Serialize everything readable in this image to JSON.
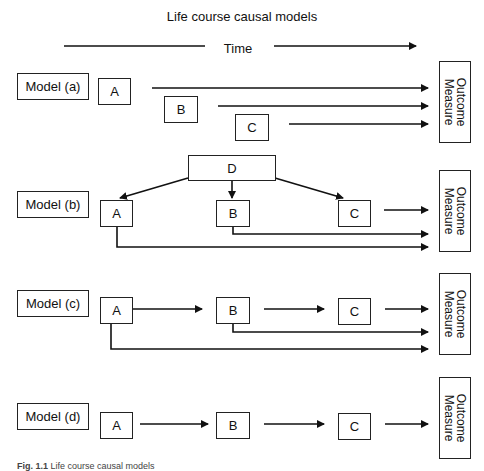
{
  "title": "Life course causal models",
  "time_axis": {
    "label": "Time"
  },
  "outcome_label": {
    "line1": "Outcome",
    "line2": "Measure"
  },
  "models": [
    {
      "id": "a",
      "label": "Model (a)",
      "nodes": [
        "A",
        "B",
        "C"
      ],
      "description": "Each of A, B, C independently affects the outcome"
    },
    {
      "id": "b",
      "label": "Model (b)",
      "nodes": [
        "D",
        "A",
        "B",
        "C"
      ],
      "description": "D influences A, B, C; each affects the outcome"
    },
    {
      "id": "c",
      "label": "Model (c)",
      "nodes": [
        "A",
        "B",
        "C"
      ],
      "description": "A to B to C chain with direct paths from A and B to outcome"
    },
    {
      "id": "d",
      "label": "Model (d)",
      "nodes": [
        "A",
        "B",
        "C"
      ],
      "description": "A to B to C chain to outcome"
    }
  ],
  "caption": {
    "prefix": "Fig. 1.1",
    "text": "Life course causal models"
  },
  "colors": {
    "line": "#111111",
    "background": "#ffffff"
  }
}
